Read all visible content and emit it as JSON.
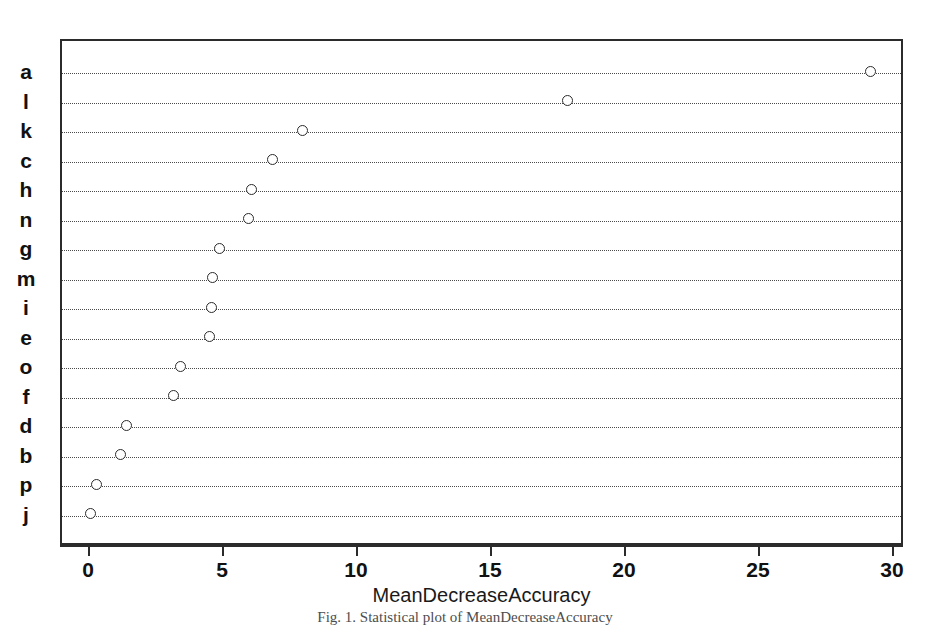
{
  "chart_data": {
    "type": "scatter",
    "plot_style": "dotplot",
    "title": "",
    "xlabel": "MeanDecreaseAccuracy",
    "ylabel": "",
    "xlim": [
      -0.35,
      31.5
    ],
    "xticks": [
      0,
      5,
      10,
      15,
      20,
      25,
      30
    ],
    "xticklabels": [
      "0",
      "5",
      "10",
      "15",
      "20",
      "25",
      "30"
    ],
    "grid": "horizontal-dotted",
    "legend": "none",
    "categories": [
      "a",
      "l",
      "k",
      "c",
      "h",
      "n",
      "g",
      "m",
      "i",
      "e",
      "o",
      "f",
      "d",
      "b",
      "p",
      "j"
    ],
    "values": [
      29.2,
      17.9,
      8.0,
      6.9,
      6.1,
      6.0,
      4.9,
      4.65,
      4.6,
      4.55,
      3.45,
      3.2,
      1.45,
      1.2,
      0.3,
      0.1
    ],
    "points": [
      {
        "label": "a",
        "value": 29.2
      },
      {
        "label": "l",
        "value": 17.9
      },
      {
        "label": "k",
        "value": 8.0
      },
      {
        "label": "c",
        "value": 6.9
      },
      {
        "label": "h",
        "value": 6.1
      },
      {
        "label": "n",
        "value": 6.0
      },
      {
        "label": "g",
        "value": 4.9
      },
      {
        "label": "m",
        "value": 4.65
      },
      {
        "label": "i",
        "value": 4.6
      },
      {
        "label": "e",
        "value": 4.55
      },
      {
        "label": "o",
        "value": 3.45
      },
      {
        "label": "f",
        "value": 3.2
      },
      {
        "label": "d",
        "value": 1.45
      },
      {
        "label": "b",
        "value": 1.2
      },
      {
        "label": "p",
        "value": 0.3
      },
      {
        "label": "j",
        "value": 0.1
      }
    ],
    "marker": "open-circle",
    "marker_color": "#2b2b2b",
    "gridline_color": "#4a4a4a",
    "axis_color": "#2b2b2b"
  },
  "caption": {
    "text": "Fig. 1.  Statistical plot of MeanDecreaseAccuracy"
  }
}
